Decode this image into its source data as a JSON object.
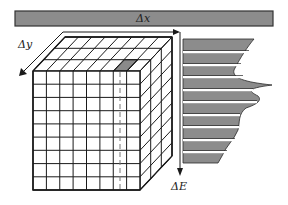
{
  "labels": {
    "delta_x": "Δx",
    "delta_y": "Δy",
    "delta_e": "ΔE"
  },
  "colors": {
    "bar_fill": "#8c8c8c",
    "bar_stroke": "#333333",
    "line": "#1a1a1a",
    "highlight_cell": "#8a8a8a",
    "stripe_fill": "#8c8c8c",
    "background": "#ffffff"
  },
  "cube": {
    "front_columns": 8,
    "front_rows": 9,
    "depth_cells": 3,
    "highlighted_column_index": 6,
    "description": "Data cube of voxels: spatial axes Δx, Δy and energy axis ΔE"
  },
  "spectrum": {
    "stripe_count": 10,
    "description": "Energy spectrum extracted from highlighted column, shown as gray horizontal stripes with peaks"
  }
}
